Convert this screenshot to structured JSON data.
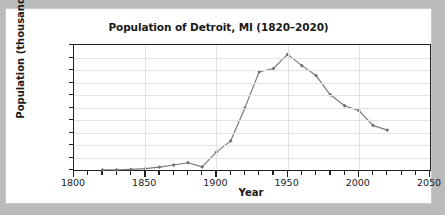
{
  "figure": {
    "background_color": "#ffffff",
    "page_background_color": "#b9bbbd",
    "border_color": "#c9cacc"
  },
  "chart_data": {
    "type": "line",
    "title": "Population of Detroit, MI (1820–2020)",
    "xlabel": "Year",
    "ylabel": "Population (thousands)",
    "xlim": [
      1800,
      2050
    ],
    "ylim": [
      0,
      2000
    ],
    "xticks": [
      1800,
      1850,
      1900,
      1950,
      2000,
      2050
    ],
    "xtick_labels": [
      "1800",
      "1850",
      "1900",
      "1950",
      "2000",
      "2050"
    ],
    "x_minor_tick_step": 10,
    "yticks": [
      0,
      200,
      400,
      600,
      800,
      1000,
      1200,
      1400,
      1600,
      1800,
      2000
    ],
    "ytick_labels": [
      "0",
      "200",
      "400",
      "600",
      "800",
      "1000",
      "1200",
      "1400",
      "1600",
      "1800",
      "2000"
    ],
    "grid": true,
    "grid_color": "#e3e3e3",
    "legend": false,
    "line_color": "#7a7a7a",
    "marker": "diamond",
    "marker_color": "#6e6e6e",
    "x": [
      1820,
      1830,
      1840,
      1850,
      1860,
      1870,
      1880,
      1890,
      1900,
      1910,
      1920,
      1930,
      1940,
      1950,
      1960,
      1970,
      1980,
      1990,
      2000,
      2010,
      2020
    ],
    "values": [
      1.4,
      2.2,
      9.1,
      21.0,
      45.6,
      80.0,
      116.3,
      50.0,
      285.7,
      465.8,
      993.7,
      1568.7,
      1623.5,
      1849.6,
      1670.1,
      1511.5,
      1203.3,
      1027.9,
      951.3,
      713.8,
      639.1
    ],
    "series": [
      {
        "name": "Population of Detroit, MI",
        "values": [
          1.4,
          2.2,
          9.1,
          21.0,
          45.6,
          80.0,
          116.3,
          50.0,
          285.7,
          465.8,
          993.7,
          1568.7,
          1623.5,
          1849.6,
          1670.1,
          1511.5,
          1203.3,
          1027.9,
          951.3,
          713.8,
          639.1
        ]
      }
    ]
  }
}
